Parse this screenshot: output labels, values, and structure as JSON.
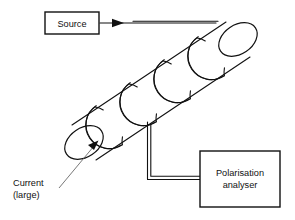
{
  "figure": {
    "kind": "faraday-effect-apparatus-diagram",
    "background_color": "#ffffff",
    "line_color": "#111111",
    "leader_color": "#555555"
  },
  "source_box": {
    "label": "Source",
    "x": 45,
    "y": 12,
    "width": 54,
    "height": 22
  },
  "analyser_box": {
    "label_line1": "Polarisation",
    "label_line2": "analyser",
    "x": 200,
    "y": 151,
    "width": 80,
    "height": 56
  },
  "current_label": {
    "line1": "Current",
    "line2": "(large)"
  },
  "beam": {
    "arrow_name": "beam-direction-arrow"
  },
  "solenoid": {
    "turn_count": 4
  }
}
